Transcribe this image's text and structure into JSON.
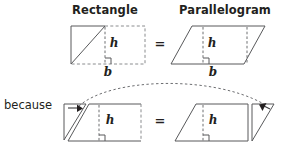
{
  "figure": {
    "kind": "geometry-proof-diagram",
    "topic": "Area of a parallelogram equals area of a rectangle",
    "background_color": "#ffffff",
    "stroke_color": "#58595b",
    "dashed_color": "#8a8c8e",
    "text_color": "#231f20"
  },
  "headers": {
    "left": "Rectangle",
    "right": "Parallelogram"
  },
  "top_row": {
    "left_shape": {
      "name": "rectangle",
      "height_label": "h",
      "base_label": "b",
      "has_diagonal_cut": true,
      "has_right_angle_mark": true
    },
    "relation": "=",
    "right_shape": {
      "name": "parallelogram",
      "height_label": "h",
      "base_label": "b",
      "has_right_angle_mark": true
    }
  },
  "connector": {
    "text": "because",
    "arc_style": "dashed"
  },
  "bottom_row": {
    "left_shape": {
      "name": "rectangle-with-triangle-moved-left",
      "height_label": "h",
      "arrow_direction": "right",
      "has_right_angle_mark": true
    },
    "relation": "=",
    "right_shape": {
      "name": "parallelogram-with-triangle-moved-right",
      "height_label": "h",
      "arrow_direction": "left",
      "has_right_angle_mark": true
    }
  },
  "icons": {
    "move-arrow-right": "arrow-right-icon",
    "move-arrow-left": "arrow-left-icon",
    "equals": "equals-icon"
  }
}
